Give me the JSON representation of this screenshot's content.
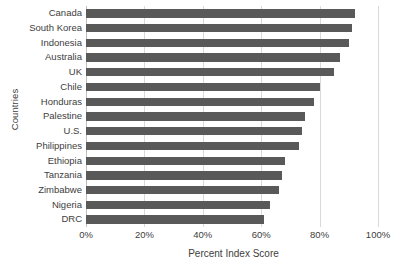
{
  "chart_data": {
    "type": "bar",
    "orientation": "horizontal",
    "title": "",
    "xlabel": "Percent Index Score",
    "ylabel": "Countries",
    "xlim": [
      0,
      100
    ],
    "xticks": [
      "0%",
      "20%",
      "40%",
      "60%",
      "80%",
      "100%"
    ],
    "xtick_values": [
      0,
      20,
      40,
      60,
      80,
      100
    ],
    "grid": true,
    "legend": false,
    "bar_color": "#595959",
    "gridline_color": "#d9d9d9",
    "categories": [
      "Canada",
      "South Korea",
      "Indonesia",
      "Australia",
      "UK",
      "Chile",
      "Honduras",
      "Palestine",
      "U.S.",
      "Philippines",
      "Ethiopia",
      "Tanzania",
      "Zimbabwe",
      "Nigeria",
      "DRC"
    ],
    "values": [
      92,
      91,
      90,
      87,
      85,
      80,
      78,
      75,
      74,
      73,
      68,
      67,
      66,
      63,
      61
    ]
  }
}
